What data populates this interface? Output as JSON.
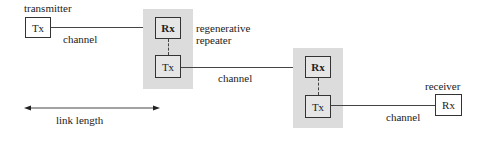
{
  "diagram": {
    "transmitter": {
      "label": "transmitter",
      "box": "Tx"
    },
    "repeater1": {
      "label_line1": "regenerative",
      "label_line2": "repeater",
      "rx": "Rx",
      "tx": "Tx"
    },
    "repeater2": {
      "rx": "Rx",
      "tx": "Tx"
    },
    "receiver": {
      "label": "receiver",
      "box": "Rx"
    },
    "channels": [
      "channel",
      "channel",
      "channel"
    ],
    "link_length": {
      "label": "link length"
    },
    "colors": {
      "shade": "#dcdcdc",
      "line": "#444444",
      "box_border": "#333333"
    }
  }
}
